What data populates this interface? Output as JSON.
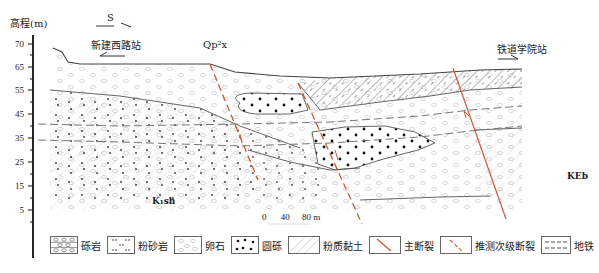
{
  "axis": {
    "title": "高程(m)",
    "ticks": [
      "70",
      "65",
      "55",
      "45",
      "35",
      "25",
      "15",
      "5"
    ]
  },
  "labels": {
    "direction_s": "S",
    "station_left": "新建西路站",
    "station_right": "铁道学院站",
    "formation_top": "Qp²x",
    "formation_left": "K₁sh",
    "formation_right": "KEb"
  },
  "scale_bar": {
    "ticks": [
      "0",
      "40",
      "80 m"
    ]
  },
  "legend": {
    "items": [
      {
        "label": "砾岩",
        "pattern": "conglomerate"
      },
      {
        "label": "粉砂岩",
        "pattern": "siltstone"
      },
      {
        "label": "卵石",
        "pattern": "pebble"
      },
      {
        "label": "圆砾",
        "pattern": "round-gravel"
      },
      {
        "label": "粉质黏土",
        "pattern": "silty-clay"
      },
      {
        "label": "主断裂",
        "pattern": "main-fault"
      },
      {
        "label": "推测次级断裂",
        "pattern": "inferred-secondary-fault"
      },
      {
        "label": "地铁",
        "pattern": "metro"
      }
    ]
  },
  "colors": {
    "fault": "#d0583a",
    "line": "#555555",
    "pattern": "#c8c8c8"
  }
}
